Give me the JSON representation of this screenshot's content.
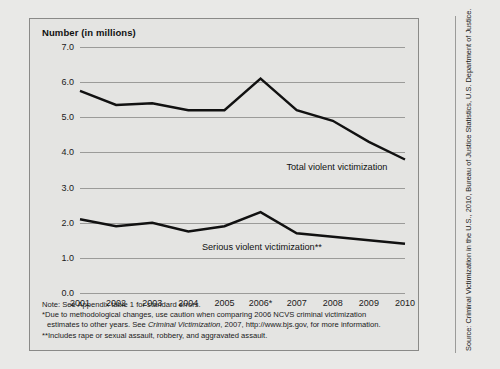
{
  "figure": {
    "title": "Number (in millions)",
    "source": "Source: Criminal Victimization in the U.S., 2010, Bureau of Justice Statistics, U.S. Department of Justice.",
    "notes": {
      "note": "Note: See Appendix table 1 for standard errors.",
      "star_part1": "*Due to methodological changes, use caution when comparing 2006 NCVS criminal victimization",
      "star_part2_pre": "estimates to other years. See ",
      "star_part2_italic": "Criminal Victimization",
      "star_part2_post": ", 2007, http://www.bjs.gov, for more information.",
      "doublestar": "**Includes rape or sexual assault, robbery, and aggravated assault."
    }
  },
  "chart_data": {
    "type": "line",
    "title": "Number (in millions)",
    "xlabel": "",
    "ylabel": "Number (in millions)",
    "categories": [
      "2001",
      "2002",
      "2003",
      "2004",
      "2005",
      "2006*",
      "2007",
      "2008",
      "2009",
      "2010"
    ],
    "x": [
      2001,
      2002,
      2003,
      2004,
      2005,
      2006,
      2007,
      2008,
      2009,
      2010
    ],
    "ylim": [
      0.0,
      7.0
    ],
    "yticks": [
      "0.0",
      "1.0",
      "2.0",
      "3.0",
      "4.0",
      "5.0",
      "6.0",
      "7.0"
    ],
    "ytick_values": [
      0.0,
      1.0,
      2.0,
      3.0,
      4.0,
      5.0,
      6.0,
      7.0
    ],
    "grid": true,
    "legend_position": "inline-annotation",
    "series": [
      {
        "name": "Total violent victimization",
        "values": [
          5.75,
          5.35,
          5.4,
          5.2,
          5.2,
          6.1,
          5.2,
          4.9,
          4.3,
          3.8
        ],
        "color": "#111111"
      },
      {
        "name": "Serious violent victimization**",
        "values": [
          2.1,
          1.9,
          2.0,
          1.75,
          1.9,
          2.3,
          1.7,
          1.6,
          1.5,
          1.4
        ],
        "color": "#111111"
      }
    ],
    "annotations": [
      {
        "text": "Total violent victimization",
        "x_frac": 0.635,
        "y_value": 3.55
      },
      {
        "text": "Serious violent victimization**",
        "x_frac": 0.375,
        "y_value": 1.27
      }
    ]
  }
}
